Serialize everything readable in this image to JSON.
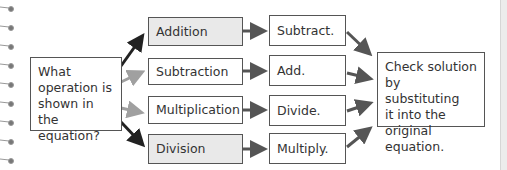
{
  "diagram": {
    "question": "What\noperation is\nshown in the\nequation?",
    "operations": [
      {
        "label": "Addition",
        "inverse": "Subtract."
      },
      {
        "label": "Subtraction",
        "inverse": "Add."
      },
      {
        "label": "Multiplication",
        "inverse": "Divide."
      },
      {
        "label": "Division",
        "inverse": "Multiply."
      }
    ],
    "conclusion": "Check solution\nby substituting\nit into the\noriginal equation."
  },
  "colors": {
    "box_border": "#555555",
    "shaded_fill": "#e9e9e9",
    "dark_arrow": "#222222",
    "light_arrow": "#a0a0a0",
    "mid_arrow": "#555555"
  }
}
